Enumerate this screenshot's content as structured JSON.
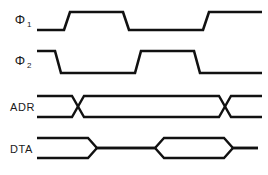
{
  "diagram": {
    "type": "timing-diagram",
    "title": "",
    "background_color": "#ffffff",
    "line_color": "#111111",
    "label_color": "#1a1a1a",
    "width": 268,
    "height": 175,
    "signals": [
      {
        "name": "phi1",
        "label_main": "Φ",
        "label_sub": "1",
        "label_full": "Φ1",
        "style": "logic",
        "label_x": 20,
        "label_y": 24,
        "high_y": 12,
        "low_y": 30,
        "start_x": 37,
        "end_x": 262,
        "initial_level": "low",
        "transitions": [
          {
            "x": 68,
            "to": "high"
          },
          {
            "x": 127,
            "to": "low"
          },
          {
            "x": 207,
            "to": "high"
          }
        ],
        "path": "M 37 30 L 64 30 L 70 12 L 123 12 L 129 30 L 203 30 L 209 12 L 262 12"
      },
      {
        "name": "phi2",
        "label_main": "Φ",
        "label_sub": "2",
        "label_full": "Φ2",
        "style": "logic",
        "label_x": 20,
        "label_y": 65,
        "high_y": 51,
        "low_y": 73,
        "start_x": 37,
        "end_x": 262,
        "initial_level": "high",
        "transitions": [
          {
            "x": 58,
            "to": "low"
          },
          {
            "x": 139,
            "to": "high"
          },
          {
            "x": 198,
            "to": "low"
          }
        ],
        "path": "M 37 51 L 55 51 L 61 73 L 135 73 L 141 51 L 194 51 L 200 73 L 262 73"
      },
      {
        "name": "adr",
        "label_main": "ADR",
        "label_sub": "",
        "label_full": "ADR",
        "style": "bus",
        "label_x": 10,
        "label_y": 111,
        "top_y": 96,
        "bottom_y": 117,
        "mid_y": 106.5,
        "start_x": 37,
        "end_x": 262,
        "crossings": [
          {
            "x": 78,
            "width": 12
          },
          {
            "x": 225,
            "width": 12
          }
        ],
        "path_top": "M 37 96 L 72 96 L 84 117 L 219 117 L 231 96 L 262 96",
        "path_bottom": "M 37 117 L 72 117 L 84 96 L 219 96 L 231 117 L 262 117"
      },
      {
        "name": "dta",
        "label_main": "DTA",
        "label_sub": "",
        "label_full": "DTA",
        "style": "bus",
        "label_x": 10,
        "label_y": 153,
        "top_y": 138,
        "bottom_y": 158,
        "mid_y": 148,
        "start_x": 37,
        "end_x": 262,
        "valid_windows": [
          {
            "open_x": 37,
            "close_x": 97,
            "open_ramp": 0,
            "close_ramp": 9
          },
          {
            "open_x": 155,
            "close_x": 233,
            "open_ramp": 9,
            "close_ramp": 9
          }
        ],
        "path_top": "M 37 138 L 88 138 L 97 148 L 155 148 L 164 138 L 224 138 L 233 148 L 258 148",
        "path_bottom": "M 37 158 L 88 158 L 97 148 L 155 148 L 164 158 L 224 158 L 233 148 L 258 148"
      }
    ]
  }
}
